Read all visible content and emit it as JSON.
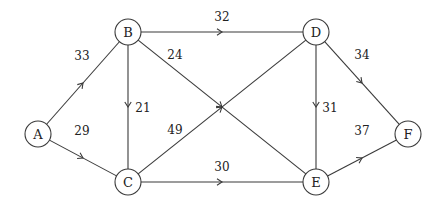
{
  "diagram": {
    "type": "directed-weighted-graph",
    "node_radius": 13,
    "colors": {
      "stroke": "#3a3a3a",
      "text": "#222222",
      "background": "#ffffff"
    },
    "nodes": [
      {
        "id": "A",
        "label": "A",
        "x": 38,
        "y": 134
      },
      {
        "id": "B",
        "label": "B",
        "x": 128,
        "y": 32
      },
      {
        "id": "C",
        "label": "C",
        "x": 128,
        "y": 182
      },
      {
        "id": "D",
        "label": "D",
        "x": 316,
        "y": 32
      },
      {
        "id": "E",
        "label": "E",
        "x": 316,
        "y": 182
      },
      {
        "id": "F",
        "label": "F",
        "x": 408,
        "y": 134
      }
    ],
    "edges": [
      {
        "from": "A",
        "to": "B",
        "weight": "33",
        "label_x": 82,
        "label_y": 56
      },
      {
        "from": "A",
        "to": "C",
        "weight": "29",
        "label_x": 82,
        "label_y": 131
      },
      {
        "from": "B",
        "to": "C",
        "weight": "21",
        "label_x": 143,
        "label_y": 108
      },
      {
        "from": "B",
        "to": "D",
        "weight": "32",
        "label_x": 222,
        "label_y": 17
      },
      {
        "from": "B",
        "to": "E",
        "weight": "24",
        "label_x": 175,
        "label_y": 55
      },
      {
        "from": "C",
        "to": "D",
        "weight": "49",
        "label_x": 175,
        "label_y": 130
      },
      {
        "from": "C",
        "to": "E",
        "weight": "30",
        "label_x": 222,
        "label_y": 167
      },
      {
        "from": "D",
        "to": "E",
        "weight": "31",
        "label_x": 330,
        "label_y": 108
      },
      {
        "from": "D",
        "to": "F",
        "weight": "34",
        "label_x": 362,
        "label_y": 55
      },
      {
        "from": "E",
        "to": "F",
        "weight": "37",
        "label_x": 362,
        "label_y": 131
      }
    ]
  }
}
